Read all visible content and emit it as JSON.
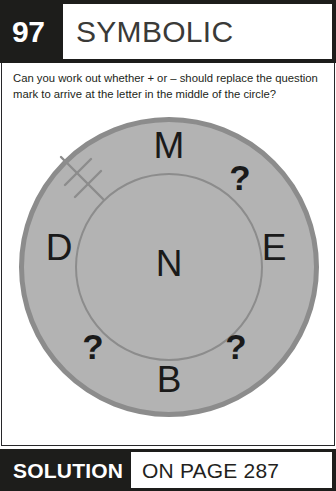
{
  "header": {
    "puzzle_number": "97",
    "title": "SYMBOLIC"
  },
  "question": {
    "text": "Can you work out whether + or – should replace the question mark to arrive at the letter in the middle of the circle?"
  },
  "diagram": {
    "type": "letter-circle-puzzle",
    "center_letter": "N",
    "ring_items": [
      {
        "position": "top",
        "label": "M"
      },
      {
        "position": "upper-right",
        "label": "?"
      },
      {
        "position": "right",
        "label": "E"
      },
      {
        "position": "lower-right",
        "label": "?"
      },
      {
        "position": "bottom",
        "label": "B"
      },
      {
        "position": "lower-left",
        "label": "?"
      },
      {
        "position": "left",
        "label": "D"
      }
    ],
    "tick_mark": "double-tick-radius-marker",
    "colors": {
      "fill": "#b3b3b3",
      "stroke": "#8c8c8c",
      "letter": "#1a1a1a"
    }
  },
  "footer": {
    "solution_label": "SOLUTION",
    "solution_page": "ON PAGE 287"
  },
  "theme": {
    "band_color": "#1d1d1b",
    "text_color": "#231f20",
    "title_color": "#3a3a38"
  }
}
